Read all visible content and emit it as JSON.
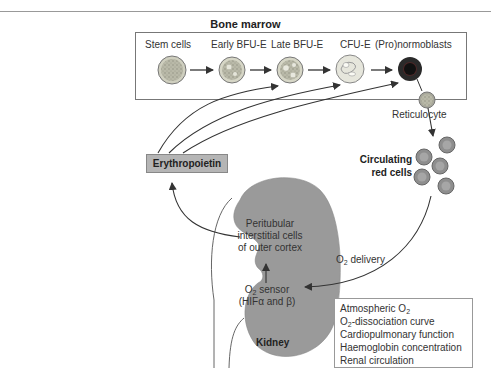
{
  "title": "Bone marrow",
  "stages": [
    {
      "label": "Stem cells"
    },
    {
      "label": "Early BFU-E"
    },
    {
      "label": "Late BFU-E"
    },
    {
      "label": "CFU-E"
    },
    {
      "label": "(Pro)normoblasts"
    }
  ],
  "reticulocyte": "Reticulocyte",
  "circulating": {
    "line1": "Circulating",
    "line2": "red cells"
  },
  "erythropoietin": "Erythropoietin",
  "kidney": {
    "label": "Kidney",
    "peritubular": [
      "Peritubular",
      "interstitial cells",
      "of outer cortex"
    ],
    "sensor_line1_prefix": "O",
    "sensor_line1_sub": "2",
    "sensor_line1_suffix": " sensor",
    "sensor_line2": "(HIFα and β)"
  },
  "o2_delivery": {
    "prefix": "O",
    "sub": "2",
    "suffix": " delivery"
  },
  "factors": [
    {
      "prefix": "Atmospheric O",
      "sub": "2",
      "suffix": ""
    },
    {
      "prefix": "O",
      "sub": "2",
      "suffix": "-dissociation curve"
    },
    {
      "prefix": "Cardiopulmonary function",
      "sub": "",
      "suffix": ""
    },
    {
      "prefix": "Haemoglobin concentration",
      "sub": "",
      "suffix": ""
    },
    {
      "prefix": "Renal circulation",
      "sub": "",
      "suffix": ""
    }
  ],
  "colors": {
    "kidney_fill": "#9a9a9a",
    "epo_box": "#b5b5b5",
    "rbc_fill": "#8e8e8e",
    "normoblast": "#2a2a2a"
  }
}
